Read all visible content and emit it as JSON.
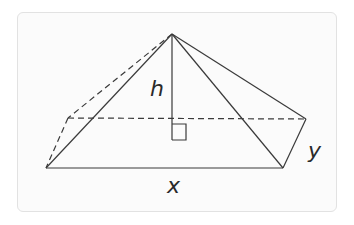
{
  "diagram": {
    "labels": {
      "height": "h",
      "base_length": "x",
      "base_width": "y"
    },
    "colors": {
      "stroke": "#3a3a3a",
      "frame_border": "#e2e2e2",
      "frame_bg": "#fbfbfb",
      "label": "#2a2a2a"
    },
    "points": {
      "apex": [
        172,
        34
      ],
      "front_left": [
        46,
        168
      ],
      "front_right": [
        283,
        168
      ],
      "back_right": [
        306,
        119
      ],
      "back_left": [
        68,
        118
      ],
      "foot": [
        172,
        118
      ]
    },
    "right_angle_marker": true
  }
}
